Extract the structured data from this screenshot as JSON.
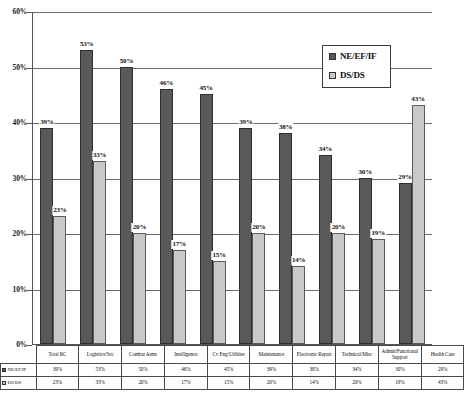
{
  "chart_data": {
    "type": "bar",
    "title": "",
    "xlabel": "",
    "ylabel": "",
    "ylim": [
      0,
      60
    ],
    "ytick_labels": [
      "60%",
      "50%",
      "40%",
      "30%",
      "20%",
      "10%",
      "0%"
    ],
    "ytick_values": [
      60,
      50,
      40,
      30,
      20,
      10,
      0
    ],
    "grid": true,
    "legend_position": "top-right",
    "categories": [
      "Total RC",
      "Logistics/Svc",
      "Combat Arms",
      "Intelligence",
      "Cv Eng/Utilities",
      "Maintenance",
      "Electronic Repair",
      "Technical/Misc",
      "Admin/Functional Support",
      "Health Care"
    ],
    "series": [
      {
        "name": "NE/EF/IF",
        "color": "#595959",
        "values": [
          39,
          53,
          50,
          46,
          45,
          39,
          38,
          34,
          30,
          29
        ],
        "labels": [
          "39%",
          "53%",
          "50%",
          "46%",
          "45%",
          "39%",
          "38%",
          "34%",
          "30%",
          "29%"
        ]
      },
      {
        "name": "DS/DS",
        "color": "#c9c9c9",
        "values": [
          23,
          33,
          20,
          17,
          15,
          20,
          14,
          20,
          19,
          43
        ],
        "labels": [
          "23%",
          "33%",
          "20%",
          "17%",
          "15%",
          "20%",
          "14%",
          "20%",
          "19%",
          "43%"
        ]
      }
    ]
  },
  "legend": {
    "items": [
      {
        "label": "NE/EF/IF"
      },
      {
        "label": "DS/DS"
      }
    ]
  },
  "table": {
    "corner": "",
    "row_labels": [
      "NE/EF/IF",
      "DS/DS"
    ]
  }
}
